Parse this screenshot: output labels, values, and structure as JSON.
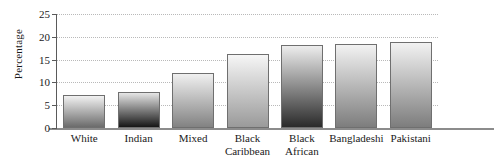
{
  "chart_data": {
    "type": "bar",
    "title": "",
    "xlabel": "",
    "ylabel": "Percentage",
    "ylim": [
      0,
      25
    ],
    "yticks": [
      0,
      5,
      10,
      15,
      20,
      25
    ],
    "grid": "horizontal-dotted",
    "legend": "none",
    "categories": [
      "White",
      "Indian",
      "Mixed",
      "Black Caribbean",
      "Black African",
      "Bangladeshi",
      "Pakistani"
    ],
    "category_lines": [
      [
        "White"
      ],
      [
        "Indian"
      ],
      [
        "Mixed"
      ],
      [
        "Black",
        "Caribbean"
      ],
      [
        "Black",
        "African"
      ],
      [
        "Bangladeshi"
      ],
      [
        "Pakistani"
      ]
    ],
    "values": [
      7.3,
      7.8,
      12.1,
      16.3,
      18.1,
      18.5,
      18.8
    ],
    "bar_styles": [
      {
        "top": "#f2f2f2",
        "bottom": "#6b6b6b"
      },
      {
        "top": "#e6e6e6",
        "bottom": "#161616"
      },
      {
        "top": "#f0f0f0",
        "bottom": "#828282"
      },
      {
        "top": "#f6f6f6",
        "bottom": "#9a9a9a"
      },
      {
        "top": "#ededed",
        "bottom": "#2a2a2a"
      },
      {
        "top": "#f2f2f2",
        "bottom": "#7d7d7d"
      },
      {
        "top": "#f2f2f2",
        "bottom": "#7d7d7d"
      }
    ],
    "bar_border_color": "#6f6f6f",
    "axis_color": "#5a5a5a",
    "gridline_color": "#b9b9b9",
    "background": "#ffffff"
  }
}
